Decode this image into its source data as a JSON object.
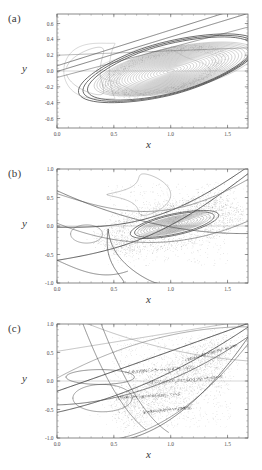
{
  "figure": {
    "background": "#ffffff",
    "panel_count": 3,
    "curve_color": "#4a4a4a",
    "scatter_color": "#777777",
    "axis_color": "#555555"
  },
  "panels": [
    {
      "id": "a",
      "label": "(a)",
      "xlabel": "x",
      "ylabel": "y",
      "xticks": [
        "0.0",
        "0.5",
        "1.0",
        "1.5"
      ],
      "xtick_values": [
        0.0,
        0.5,
        1.0,
        1.5
      ],
      "yticks": [
        "0.6",
        "0.4",
        "0.2",
        "0.0",
        "-0.2",
        "-0.4",
        "-0.6"
      ],
      "ytick_values": [
        0.6,
        0.4,
        0.2,
        0.0,
        -0.2,
        -0.4,
        -0.6
      ],
      "xlim": [
        0.0,
        1.68
      ],
      "ylim": [
        -0.72,
        0.72
      ]
    },
    {
      "id": "b",
      "label": "(b)",
      "xlabel": "x",
      "ylabel": "y",
      "xticks": [
        "0.0",
        "0.5",
        "1.0",
        "1.5"
      ],
      "xtick_values": [
        0.0,
        0.5,
        1.0,
        1.5
      ],
      "yticks": [
        "1.0",
        "0.5",
        "0.0",
        "-0.5",
        "-1.0"
      ],
      "ytick_values": [
        1.0,
        0.5,
        0.0,
        -0.5,
        -1.0
      ],
      "xlim": [
        0.0,
        1.68
      ],
      "ylim": [
        -1.0,
        1.0
      ]
    },
    {
      "id": "c",
      "label": "(c)",
      "xlabel": "x",
      "ylabel": "y",
      "xticks": [
        "0.0",
        "0.5",
        "1.0",
        "1.5"
      ],
      "xtick_values": [
        0.0,
        0.5,
        1.0,
        1.5
      ],
      "yticks": [
        "1.0",
        "0.5",
        "0.0",
        "-0.5",
        "-1.0"
      ],
      "ytick_values": [
        1.0,
        0.5,
        0.0,
        -0.5,
        -1.0
      ],
      "xlim": [
        0.0,
        1.68
      ],
      "ylim": [
        -1.0,
        1.0
      ]
    }
  ],
  "chart_data": [
    {
      "type": "scatter",
      "title": "(a)",
      "xlabel": "x",
      "ylabel": "y",
      "xlim": [
        0.0,
        1.68
      ],
      "ylim": [
        -0.72,
        0.72
      ],
      "xticks": [
        0.0,
        0.5,
        1.0,
        1.5
      ],
      "yticks": [
        -0.6,
        -0.4,
        -0.2,
        0.0,
        0.2,
        0.4,
        0.6
      ],
      "grid": false,
      "legend": "none",
      "description": "Poincare section: dense family of nested closed invariant curves (tori) around an elliptic fixed point near (1.00, 0.00), enclosed by an outer teardrop separatrix reaching x=1.62 at upper right and x=0.18 at left; several long near-straight manifold lines cross the figure diagonally.",
      "center": [
        1.0,
        0.0
      ],
      "nested_tori": {
        "count": 26,
        "center_x": 1.0,
        "center_y": 0.0,
        "tilt_deg": 22,
        "max_semi_major": 0.62,
        "max_semi_minor": 0.27
      },
      "outer_separatrix": {
        "x_min": 0.17,
        "x_max": 1.64,
        "y_min": -0.66,
        "y_max": 0.68
      },
      "manifold_lines": 5
    },
    {
      "type": "scatter",
      "title": "(b)",
      "xlabel": "x",
      "ylabel": "y",
      "xlim": [
        0.0,
        1.68
      ],
      "ylim": [
        -1.0,
        1.0
      ],
      "xticks": [
        0.0,
        0.5,
        1.0,
        1.5
      ],
      "yticks": [
        -1.0,
        -0.5,
        0.0,
        0.5,
        1.0
      ],
      "grid": false,
      "legend": "none",
      "description": "Poincare section: a tilted elliptic island of nested curves centred near (1.02, 0.02) embedded in a speckled chaotic sea spanning roughly 0.45<x<1.5, -0.7<y<0.8; several heavy hyperbola-like invariant manifolds sweep from lower-left to upper-right.",
      "center": [
        1.02,
        0.02
      ],
      "nested_tori": {
        "count": 12,
        "center_x": 1.02,
        "center_y": 0.02,
        "tilt_deg": 27,
        "max_semi_major": 0.33,
        "max_semi_minor": 0.13
      },
      "chaotic_sea": {
        "x_range": [
          0.42,
          1.55
        ],
        "y_range": [
          -0.72,
          0.82
        ],
        "point_count": 2400
      },
      "manifold_lines": 7
    },
    {
      "type": "scatter",
      "title": "(c)",
      "xlabel": "x",
      "ylabel": "y",
      "xlim": [
        0.0,
        1.68
      ],
      "ylim": [
        -1.0,
        1.0
      ],
      "xticks": [
        0.0,
        0.5,
        1.0,
        1.5
      ],
      "yticks": [
        -1.0,
        -0.5,
        0.0,
        0.5,
        1.0
      ],
      "grid": false,
      "legend": "none",
      "description": "Poincare section: fully developed chaotic sea with embedded elongated island chains appearing as dark streaks near (0.9,0.2), (0.8,-0.25), (1.35,0.5) and (0.95,-0.5); broad invariant manifold arcs cross the frame, the strongest running from (0.0,-0.18) up to (1.62,1.0).",
      "island_chains": [
        {
          "x": 0.9,
          "y": 0.2,
          "length": 0.3,
          "angle_deg": 8
        },
        {
          "x": 0.8,
          "y": -0.26,
          "length": 0.28,
          "angle_deg": 6
        },
        {
          "x": 1.35,
          "y": 0.5,
          "length": 0.26,
          "angle_deg": 30
        },
        {
          "x": 0.97,
          "y": -0.5,
          "length": 0.22,
          "angle_deg": 12
        },
        {
          "x": 1.12,
          "y": 0.02,
          "length": 0.34,
          "angle_deg": 10
        }
      ],
      "chaotic_sea": {
        "x_range": [
          0.45,
          1.55
        ],
        "y_range": [
          -0.8,
          0.8
        ],
        "point_count": 3000
      },
      "manifold_lines": 8
    }
  ]
}
